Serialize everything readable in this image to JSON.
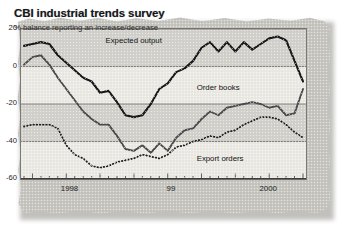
{
  "header": {
    "title": "CBI industrial trends survey",
    "subtitle": "% balance reporting an increase/decrease"
  },
  "colors": {
    "newsprint": "#c9c8c2",
    "plot_bg": "#eceae4",
    "band": "#d2d0ca",
    "expected_output": "#17171a",
    "order_books": "#4a4a4c",
    "export_orders": "#1d1d1f",
    "frame": "#7c7a74"
  },
  "chart_data": {
    "type": "line",
    "title": "CBI industrial trends survey",
    "subtitle": "% balance reporting an increase/decrease",
    "xlabel": "",
    "ylabel": "% balance reporting an increase/decrease",
    "ylim": [
      -60,
      20
    ],
    "yticks": [
      20,
      0,
      -20,
      -40,
      -60
    ],
    "ytick_labels": [
      "20",
      "0",
      "-20",
      "-40",
      "-60"
    ],
    "xlim": [
      0,
      33
    ],
    "xtick_labels": [
      "1998",
      "99",
      "2000"
    ],
    "xtick_positions": [
      5.5,
      17.5,
      29.0
    ],
    "grid": "horizontal",
    "legend_position": "inline-annotations",
    "n_points": 34,
    "series": [
      {
        "name": "Expected output",
        "style": "solid-thick",
        "color": "#17171a",
        "values": [
          11,
          12,
          13,
          12,
          6,
          2,
          -2,
          -6,
          -8,
          -14,
          -13,
          -19,
          -26,
          -27,
          -26,
          -20,
          -12,
          -9,
          -3,
          -1,
          3,
          10,
          13,
          8,
          13,
          8,
          13,
          9,
          12,
          15,
          16,
          14,
          3,
          -8
        ]
      },
      {
        "name": "Order books",
        "style": "solid-medium",
        "color": "#4a4a4c",
        "values": [
          1,
          5,
          6,
          1,
          -6,
          -12,
          -18,
          -24,
          -28,
          -31,
          -31,
          -37,
          -44,
          -45,
          -42,
          -46,
          -41,
          -45,
          -38,
          -34,
          -33,
          -28,
          -24,
          -26,
          -22,
          -21,
          -20,
          -19,
          -20,
          -22,
          -21,
          -26,
          -25,
          -12
        ]
      },
      {
        "name": "Export orders",
        "style": "dotted",
        "color": "#1d1d1f",
        "values": [
          -32,
          -31,
          -31,
          -31,
          -33,
          -42,
          -47,
          -49,
          -53,
          -54,
          -53,
          -51,
          -50,
          -49,
          -47,
          -48,
          -49,
          -47,
          -43,
          -42,
          -40,
          -39,
          -37,
          -38,
          -35,
          -34,
          -31,
          -29,
          -27,
          -27,
          -28,
          -31,
          -35,
          -38
        ]
      }
    ],
    "annotations": [
      {
        "text": "Expected output",
        "x_frac": 0.3,
        "y_value": 13
      },
      {
        "text": "Order books",
        "x_frac": 0.62,
        "y_value": -12
      },
      {
        "text": "Export orders",
        "x_frac": 0.62,
        "y_value": -50
      }
    ]
  }
}
